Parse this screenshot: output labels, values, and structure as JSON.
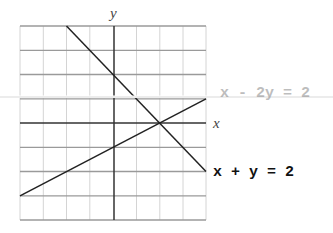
{
  "diagram": {
    "type": "coordinate-graph",
    "axis_labels": {
      "x": "x",
      "y": "y"
    },
    "x_range": [
      -4,
      4
    ],
    "y_range": [
      -4,
      4
    ],
    "grid_step": 1,
    "lines": [
      {
        "name": "line-x-plus-y",
        "equation": "x + y = 2",
        "from": [
          -2,
          4
        ],
        "to": [
          4,
          -2
        ]
      },
      {
        "name": "line-x-minus-2y",
        "equation": "x - 2y = 2",
        "from": [
          -4,
          -3
        ],
        "to": [
          4,
          1
        ]
      }
    ],
    "intersection": [
      2,
      0
    ],
    "labels": {
      "eq1": "x + y = 2",
      "eq2": "x - 2y = 2"
    },
    "colors": {
      "grid": "#c8c8c8",
      "major_grid": "#9a9a9a",
      "axis": "#333333",
      "line": "#222222"
    }
  }
}
